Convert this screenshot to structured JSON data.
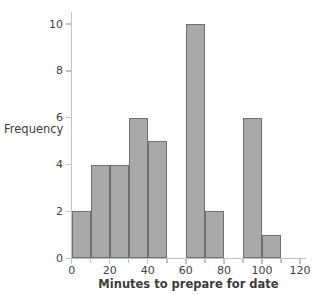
{
  "chart_data": {
    "type": "bar",
    "subtype": "histogram",
    "title": "",
    "xlabel": "Minutes to prepare for date",
    "ylabel": "Frequency",
    "xlim": [
      0,
      120
    ],
    "ylim": [
      0,
      10
    ],
    "bin_width": 10,
    "grid": false,
    "legend": null,
    "categories": [
      "0-10",
      "10-20",
      "20-30",
      "30-40",
      "40-50",
      "50-60",
      "60-70",
      "70-80",
      "80-90",
      "90-100",
      "100-110",
      "110-120"
    ],
    "bin_edges": [
      0,
      10,
      20,
      30,
      40,
      50,
      60,
      70,
      80,
      90,
      100,
      110,
      120
    ],
    "values": [
      2,
      4,
      4,
      6,
      5,
      0,
      10,
      2,
      0,
      6,
      1,
      0
    ],
    "bars": [
      {
        "name": "bin-0-10",
        "x0": 0,
        "x1": 10,
        "value": 2
      },
      {
        "name": "bin-10-20",
        "x0": 10,
        "x1": 20,
        "value": 4
      },
      {
        "name": "bin-20-30",
        "x0": 20,
        "x1": 30,
        "value": 4
      },
      {
        "name": "bin-30-40",
        "x0": 30,
        "x1": 40,
        "value": 6
      },
      {
        "name": "bin-40-50",
        "x0": 40,
        "x1": 50,
        "value": 5
      },
      {
        "name": "bin-50-60",
        "x0": 50,
        "x1": 60,
        "value": 0
      },
      {
        "name": "bin-60-70",
        "x0": 60,
        "x1": 70,
        "value": 10
      },
      {
        "name": "bin-70-80",
        "x0": 70,
        "x1": 80,
        "value": 2
      },
      {
        "name": "bin-80-90",
        "x0": 80,
        "x1": 90,
        "value": 0
      },
      {
        "name": "bin-90-100",
        "x0": 90,
        "x1": 100,
        "value": 6
      },
      {
        "name": "bin-100-110",
        "x0": 100,
        "x1": 110,
        "value": 1
      },
      {
        "name": "bin-110-120",
        "x0": 110,
        "x1": 120,
        "value": 0
      }
    ],
    "xticks": [
      0,
      20,
      40,
      60,
      80,
      100,
      120
    ],
    "xtick_labels": [
      "0",
      "20",
      "40",
      "60",
      "80",
      "100",
      "120"
    ],
    "xticks_minor": [
      10,
      30,
      50,
      70,
      90,
      110
    ],
    "yticks": [
      0,
      2,
      4,
      6,
      8,
      10
    ],
    "ytick_labels": [
      "0",
      "2",
      "4",
      "6",
      "8",
      "10"
    ],
    "colors": {
      "bar_fill": "#a9a9a9",
      "bar_border": "#6f6f6f",
      "axis": "#c2c2c2",
      "text": "#3b3b3b",
      "background": "#ffffff"
    }
  }
}
